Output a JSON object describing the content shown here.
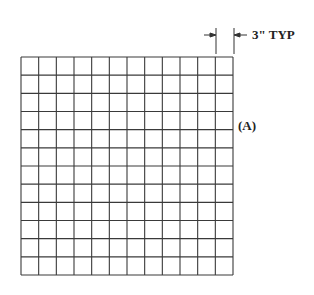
{
  "diagram": {
    "grid": {
      "columns": 12,
      "rows": 12,
      "x0": 21,
      "y0": 57,
      "x1": 233,
      "y1": 275,
      "line_color": "#3a3a3a"
    },
    "dimension": {
      "label": "3\" TYP",
      "ext_left_x": 216,
      "ext_right_x": 234
    },
    "callout": {
      "label": "(A)"
    }
  }
}
